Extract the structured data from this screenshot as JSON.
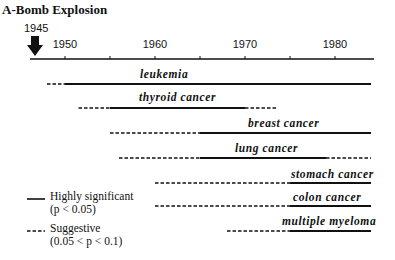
{
  "chart_data": {
    "type": "timeline",
    "title": "A-Bomb Explosion",
    "event_marker": {
      "label": "1945",
      "year": 1945,
      "icon": "down-arrow-icon"
    },
    "xaxis": {
      "range": [
        1944,
        1985
      ],
      "major_ticks": [
        1950,
        1960,
        1970,
        1980
      ],
      "minor_ticks": [
        1955,
        1965,
        1975
      ],
      "tick_labels": [
        "1950",
        "1960",
        "1970",
        "1980"
      ]
    },
    "series": [
      {
        "name": "leukemia",
        "segments": [
          {
            "style": "suggestive",
            "start": 1948,
            "end": 1950
          },
          {
            "style": "significant",
            "start": 1950,
            "end": 1984
          }
        ]
      },
      {
        "name": "thyroid cancer",
        "segments": [
          {
            "style": "suggestive",
            "start": 1951.5,
            "end": 1955
          },
          {
            "style": "significant",
            "start": 1955,
            "end": 1970
          },
          {
            "style": "suggestive",
            "start": 1970,
            "end": 1973.5
          }
        ]
      },
      {
        "name": "breast cancer",
        "segments": [
          {
            "style": "suggestive",
            "start": 1955,
            "end": 1965
          },
          {
            "style": "significant",
            "start": 1965,
            "end": 1984
          }
        ]
      },
      {
        "name": "lung cancer",
        "segments": [
          {
            "style": "suggestive",
            "start": 1956,
            "end": 1965
          },
          {
            "style": "significant",
            "start": 1965,
            "end": 1979
          },
          {
            "style": "suggestive",
            "start": 1979,
            "end": 1984
          }
        ]
      },
      {
        "name": "stomach cancer",
        "segments": [
          {
            "style": "suggestive",
            "start": 1960,
            "end": 1975
          },
          {
            "style": "significant",
            "start": 1975,
            "end": 1984
          }
        ]
      },
      {
        "name": "colon cancer",
        "segments": [
          {
            "style": "suggestive",
            "start": 1960,
            "end": 1975
          },
          {
            "style": "significant",
            "start": 1975,
            "end": 1984
          }
        ]
      },
      {
        "name": "multiple myeloma",
        "segments": [
          {
            "style": "suggestive",
            "start": 1968,
            "end": 1975
          },
          {
            "style": "significant",
            "start": 1975,
            "end": 1984
          }
        ]
      }
    ],
    "legend": {
      "placement": "bottom-left",
      "entries": [
        {
          "style": "significant",
          "line1": "Highly significant",
          "line2": "(p < 0.05)"
        },
        {
          "style": "suggestive",
          "line1": "Suggestive",
          "line2": "(0.05 < p < 0.1)"
        }
      ]
    },
    "colors": {
      "ink": "#111111",
      "background": "#ffffff"
    }
  }
}
